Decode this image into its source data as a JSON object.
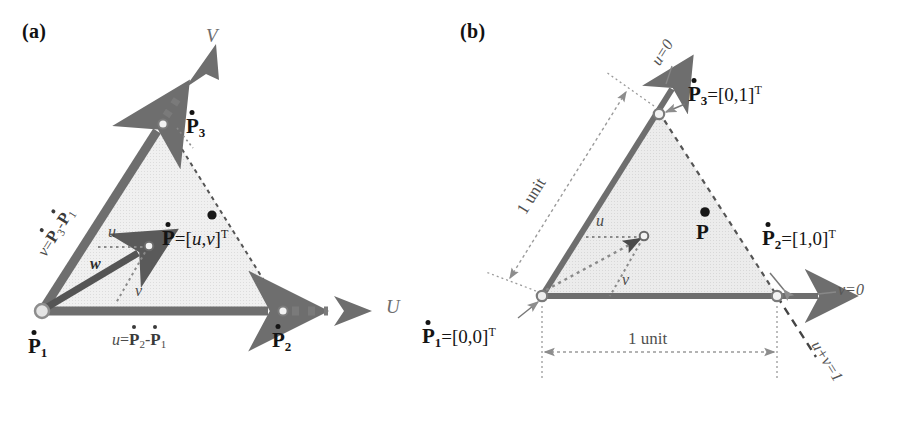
{
  "figure": {
    "type": "diagram",
    "panels": [
      {
        "id": "a",
        "label": "(a)",
        "description": "Triangle in model space with edge vectors u and v from vertex P1, and interior point P located by w = u*u + v*v",
        "vertices": [
          {
            "name": "P1",
            "label_base": "P",
            "subscript": "1",
            "x": 42,
            "y": 311,
            "marker": "open-circle"
          },
          {
            "name": "P2",
            "label_base": "P",
            "subscript": "2",
            "x": 283,
            "y": 311,
            "marker": "open-circle"
          },
          {
            "name": "P3",
            "label_base": "P",
            "subscript": "3",
            "x": 165,
            "y": 122,
            "marker": "open-circle"
          }
        ],
        "axes": [
          {
            "name": "U",
            "label": "U",
            "direction": "horizontal-right"
          },
          {
            "name": "V",
            "label": "V",
            "direction": "diagonal-up-right"
          }
        ],
        "vertex_labels": [
          {
            "key": "p1",
            "base": "P",
            "sub": "1"
          },
          {
            "key": "p2",
            "base": "P",
            "sub": "2"
          },
          {
            "key": "p3",
            "base": "P",
            "sub": "3"
          }
        ],
        "edge_vector_u": {
          "prefix": "u",
          "eq": "=",
          "term1_base": "P",
          "term1_sub": "2",
          "minus": "-",
          "term2_base": "P",
          "term2_sub": "1"
        },
        "edge_vector_v": {
          "prefix": "v",
          "eq": "=",
          "term1_base": "P",
          "term1_sub": "3",
          "minus": "-",
          "term2_base": "P",
          "term2_sub": "1"
        },
        "interior_point": {
          "base": "P",
          "eq": "=",
          "bracket_open": "[",
          "u": "u",
          "comma": ",",
          "v": "v",
          "bracket_close": "]",
          "transpose": "T"
        },
        "scalar_labels": [
          {
            "key": "u",
            "text": "u"
          },
          {
            "key": "w",
            "text": "w"
          },
          {
            "key": "v",
            "text": "v"
          }
        ]
      },
      {
        "id": "b",
        "label": "(b)",
        "description": "Unit parameter triangle with vertices at [0,0], [1,0], [0,1]; edges labelled u=0, v=0, u+v=1 and both legs 1 unit long",
        "vertices": [
          {
            "name": "P1",
            "label_base": "P",
            "subscript": "1",
            "value": "[0,0]",
            "transpose": "T",
            "x": 102,
            "y": 296,
            "marker": "open-circle"
          },
          {
            "name": "P2",
            "label_base": "P",
            "subscript": "2",
            "value": "[1,0]",
            "transpose": "T",
            "x": 337,
            "y": 296,
            "marker": "open-circle"
          },
          {
            "name": "P3",
            "label_base": "P",
            "subscript": "3",
            "value": "[0,1]",
            "transpose": "T",
            "x": 219,
            "y": 112,
            "marker": "open-circle"
          }
        ],
        "edge_equations": [
          {
            "key": "u0",
            "text": "u=0",
            "lhs": "u",
            "eq": "=",
            "rhs": "0"
          },
          {
            "key": "v0",
            "text": "v=0",
            "lhs": "v",
            "eq": "=",
            "rhs": "0"
          },
          {
            "key": "uv1",
            "text": "u+v=1",
            "lhs": "u+v",
            "eq": "=",
            "rhs": "1"
          }
        ],
        "dimension_labels": [
          {
            "key": "unit-horizontal",
            "text": "1 unit"
          },
          {
            "key": "unit-diagonal",
            "text": "1 unit"
          }
        ],
        "interior_point": {
          "base": "P"
        },
        "scalar_labels": [
          {
            "key": "u",
            "text": "u"
          },
          {
            "key": "v",
            "text": "v"
          }
        ]
      }
    ]
  },
  "colors": {
    "background": "#ffffff",
    "triangle_fill": "#ededed",
    "triangle_fill_b": "#e9e9e9",
    "solid_vector": "#6e6e6e",
    "dark_vector": "#4a4a4a",
    "dashed_edge": "#555555",
    "dotted_guide": "#8a8a8a",
    "text": "#1a1a1a",
    "axis_text": "#6d6d6d"
  }
}
